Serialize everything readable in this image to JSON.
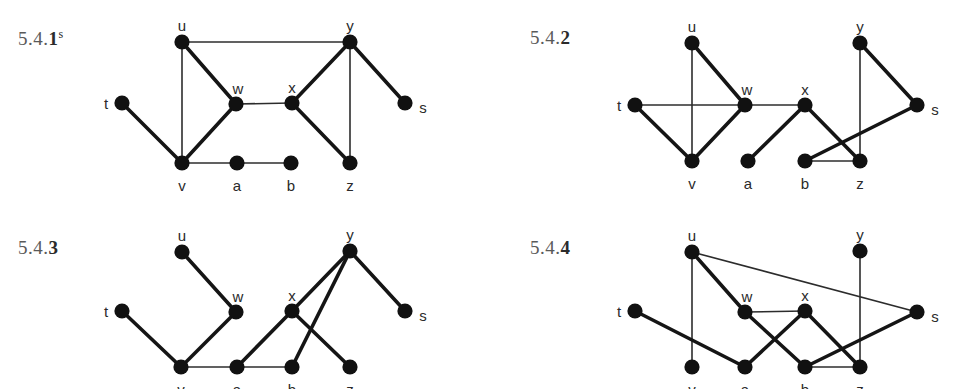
{
  "page": {
    "background": "#ffffff",
    "node_color": "#111111",
    "edge_color": "#2c2c2c",
    "label_color": "#5a5a5a"
  },
  "figures": [
    {
      "id": "fig-5-4-1",
      "label_prefix": "5.4.",
      "label_number": "1",
      "label_superscript": "s",
      "label_x": 18,
      "label_y": 27,
      "nodes": [
        {
          "name": "u",
          "x": 182,
          "y": 42,
          "label_dx": 0,
          "label_dy": -16
        },
        {
          "name": "y",
          "x": 350,
          "y": 42,
          "label_dx": 0,
          "label_dy": -16
        },
        {
          "name": "t",
          "x": 122,
          "y": 103,
          "label_dx": -16,
          "label_dy": 1
        },
        {
          "name": "w",
          "x": 236,
          "y": 104,
          "label_dx": 2,
          "label_dy": -15
        },
        {
          "name": "x",
          "x": 292,
          "y": 103,
          "label_dx": 0,
          "label_dy": -15
        },
        {
          "name": "s",
          "x": 405,
          "y": 103,
          "label_dx": 18,
          "label_dy": 5
        },
        {
          "name": "v",
          "x": 182,
          "y": 163,
          "label_dx": 0,
          "label_dy": 23
        },
        {
          "name": "a",
          "x": 237,
          "y": 163,
          "label_dx": 0,
          "label_dy": 23
        },
        {
          "name": "b",
          "x": 291,
          "y": 163,
          "label_dx": 0,
          "label_dy": 23
        },
        {
          "name": "z",
          "x": 350,
          "y": 163,
          "label_dx": 0,
          "label_dy": 23
        }
      ],
      "edges": [
        {
          "from": "u",
          "to": "y",
          "weight": "thin"
        },
        {
          "from": "u",
          "to": "v",
          "weight": "thin"
        },
        {
          "from": "u",
          "to": "w",
          "weight": "thick"
        },
        {
          "from": "t",
          "to": "v",
          "weight": "thick"
        },
        {
          "from": "w",
          "to": "v",
          "weight": "thick"
        },
        {
          "from": "w",
          "to": "x",
          "weight": "thin"
        },
        {
          "from": "x",
          "to": "y",
          "weight": "thick"
        },
        {
          "from": "x",
          "to": "z",
          "weight": "thick"
        },
        {
          "from": "y",
          "to": "z",
          "weight": "thin"
        },
        {
          "from": "y",
          "to": "s",
          "weight": "thick"
        },
        {
          "from": "v",
          "to": "a",
          "weight": "thin"
        },
        {
          "from": "a",
          "to": "b",
          "weight": "thin"
        }
      ]
    },
    {
      "id": "fig-5-4-2",
      "label_prefix": "5.4.",
      "label_number": "2",
      "label_superscript": "",
      "label_x": 530,
      "label_y": 27,
      "nodes": [
        {
          "name": "u",
          "x": 692,
          "y": 43,
          "label_dx": 0,
          "label_dy": -16
        },
        {
          "name": "y",
          "x": 860,
          "y": 43,
          "label_dx": 0,
          "label_dy": -16
        },
        {
          "name": "t",
          "x": 635,
          "y": 105,
          "label_dx": -16,
          "label_dy": 1
        },
        {
          "name": "w",
          "x": 745,
          "y": 105,
          "label_dx": 2,
          "label_dy": -15
        },
        {
          "name": "x",
          "x": 805,
          "y": 105,
          "label_dx": 0,
          "label_dy": -15
        },
        {
          "name": "s",
          "x": 917,
          "y": 105,
          "label_dx": 18,
          "label_dy": 5
        },
        {
          "name": "v",
          "x": 692,
          "y": 161,
          "label_dx": 0,
          "label_dy": 23
        },
        {
          "name": "a",
          "x": 748,
          "y": 161,
          "label_dx": 0,
          "label_dy": 23
        },
        {
          "name": "b",
          "x": 805,
          "y": 161,
          "label_dx": 0,
          "label_dy": 23
        },
        {
          "name": "z",
          "x": 860,
          "y": 161,
          "label_dx": 0,
          "label_dy": 23
        }
      ],
      "edges": [
        {
          "from": "u",
          "to": "v",
          "weight": "thin"
        },
        {
          "from": "u",
          "to": "w",
          "weight": "thick"
        },
        {
          "from": "t",
          "to": "w",
          "weight": "thin"
        },
        {
          "from": "t",
          "to": "v",
          "weight": "thick"
        },
        {
          "from": "v",
          "to": "w",
          "weight": "thick"
        },
        {
          "from": "w",
          "to": "x",
          "weight": "thin"
        },
        {
          "from": "x",
          "to": "a",
          "weight": "thick"
        },
        {
          "from": "x",
          "to": "z",
          "weight": "thick"
        },
        {
          "from": "y",
          "to": "z",
          "weight": "thin"
        },
        {
          "from": "y",
          "to": "s",
          "weight": "thick"
        },
        {
          "from": "b",
          "to": "s",
          "weight": "thick"
        },
        {
          "from": "b",
          "to": "z",
          "weight": "thin"
        }
      ]
    },
    {
      "id": "fig-5-4-3",
      "label_prefix": "5.4.",
      "label_number": "3",
      "label_superscript": "",
      "label_x": 18,
      "label_y": 237,
      "nodes": [
        {
          "name": "u",
          "x": 182,
          "y": 252,
          "label_dx": 0,
          "label_dy": -16
        },
        {
          "name": "y",
          "x": 350,
          "y": 251,
          "label_dx": 0,
          "label_dy": -16
        },
        {
          "name": "t",
          "x": 122,
          "y": 311,
          "label_dx": -16,
          "label_dy": 1
        },
        {
          "name": "w",
          "x": 236,
          "y": 312,
          "label_dx": 2,
          "label_dy": -15
        },
        {
          "name": "x",
          "x": 292,
          "y": 311,
          "label_dx": 0,
          "label_dy": -15
        },
        {
          "name": "s",
          "x": 405,
          "y": 311,
          "label_dx": 18,
          "label_dy": 5
        },
        {
          "name": "v",
          "x": 181,
          "y": 367,
          "label_dx": 0,
          "label_dy": 23
        },
        {
          "name": "a",
          "x": 237,
          "y": 367,
          "label_dx": 0,
          "label_dy": 23
        },
        {
          "name": "b",
          "x": 292,
          "y": 367,
          "label_dx": 0,
          "label_dy": 23
        },
        {
          "name": "z",
          "x": 350,
          "y": 367,
          "label_dx": 0,
          "label_dy": 23
        }
      ],
      "edges": [
        {
          "from": "u",
          "to": "w",
          "weight": "thick"
        },
        {
          "from": "t",
          "to": "v",
          "weight": "thick"
        },
        {
          "from": "w",
          "to": "v",
          "weight": "thick"
        },
        {
          "from": "v",
          "to": "a",
          "weight": "thin"
        },
        {
          "from": "a",
          "to": "b",
          "weight": "thin"
        },
        {
          "from": "a",
          "to": "x",
          "weight": "thick"
        },
        {
          "from": "x",
          "to": "y",
          "weight": "thick"
        },
        {
          "from": "x",
          "to": "z",
          "weight": "thick"
        },
        {
          "from": "b",
          "to": "y",
          "weight": "thick"
        },
        {
          "from": "y",
          "to": "s",
          "weight": "thick"
        }
      ]
    },
    {
      "id": "fig-5-4-4",
      "label_prefix": "5.4.",
      "label_number": "4",
      "label_superscript": "",
      "label_x": 530,
      "label_y": 237,
      "nodes": [
        {
          "name": "u",
          "x": 692,
          "y": 252,
          "label_dx": 0,
          "label_dy": -16
        },
        {
          "name": "y",
          "x": 860,
          "y": 251,
          "label_dx": 0,
          "label_dy": -16
        },
        {
          "name": "t",
          "x": 635,
          "y": 311,
          "label_dx": -16,
          "label_dy": 1
        },
        {
          "name": "w",
          "x": 745,
          "y": 312,
          "label_dx": 2,
          "label_dy": -15
        },
        {
          "name": "x",
          "x": 805,
          "y": 311,
          "label_dx": 0,
          "label_dy": -15
        },
        {
          "name": "s",
          "x": 917,
          "y": 312,
          "label_dx": 18,
          "label_dy": 5
        },
        {
          "name": "v",
          "x": 692,
          "y": 367,
          "label_dx": 0,
          "label_dy": 23
        },
        {
          "name": "a",
          "x": 745,
          "y": 367,
          "label_dx": 0,
          "label_dy": 23
        },
        {
          "name": "b",
          "x": 805,
          "y": 367,
          "label_dx": 0,
          "label_dy": 23
        },
        {
          "name": "z",
          "x": 860,
          "y": 367,
          "label_dx": 0,
          "label_dy": 23
        }
      ],
      "edges": [
        {
          "from": "u",
          "to": "v",
          "weight": "thin"
        },
        {
          "from": "u",
          "to": "w",
          "weight": "thick"
        },
        {
          "from": "u",
          "to": "s",
          "weight": "thin"
        },
        {
          "from": "t",
          "to": "a",
          "weight": "thick"
        },
        {
          "from": "w",
          "to": "x",
          "weight": "thin"
        },
        {
          "from": "w",
          "to": "b",
          "weight": "thick"
        },
        {
          "from": "x",
          "to": "a",
          "weight": "thick"
        },
        {
          "from": "x",
          "to": "z",
          "weight": "thick"
        },
        {
          "from": "y",
          "to": "z",
          "weight": "thin"
        },
        {
          "from": "b",
          "to": "z",
          "weight": "thin"
        },
        {
          "from": "b",
          "to": "s",
          "weight": "thick"
        }
      ]
    }
  ]
}
